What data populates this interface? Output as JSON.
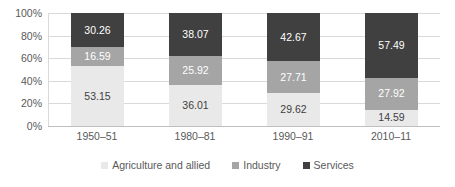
{
  "chart_data": {
    "type": "bar",
    "subtype": "100% stacked column",
    "title": "",
    "xlabel": "",
    "ylabel": "",
    "categories": [
      "1950–51",
      "1980–81",
      "1990–91",
      "2010–11"
    ],
    "series": [
      {
        "name": "Agriculture and allied",
        "color": "#e9e9e9",
        "label_color": "#3f3f3f",
        "values": [
          53.15,
          36.01,
          29.62,
          14.59
        ],
        "labels": [
          "53.15",
          "36.01",
          "29.62",
          "14.59"
        ]
      },
      {
        "name": "Industry",
        "color": "#a5a5a5",
        "label_color": "#ffffff",
        "values": [
          16.59,
          25.92,
          27.71,
          27.92
        ],
        "labels": [
          "16.59",
          "25.92",
          "27.71",
          "27.92"
        ]
      },
      {
        "name": "Services",
        "color": "#404040",
        "label_color": "#ffffff",
        "values": [
          30.26,
          38.07,
          42.67,
          57.49
        ],
        "labels": [
          "30.26",
          "38.07",
          "42.67",
          "57.49"
        ]
      }
    ],
    "ylim": [
      0,
      100
    ],
    "y_ticks": [
      0,
      20,
      40,
      60,
      80,
      100
    ],
    "y_tick_labels": [
      "0%",
      "20%",
      "40%",
      "60%",
      "80%",
      "100%"
    ],
    "grid": true,
    "legend_position": "bottom",
    "axis_color": "#d9d9d9",
    "text_color": "#595959",
    "background": "#ffffff"
  }
}
